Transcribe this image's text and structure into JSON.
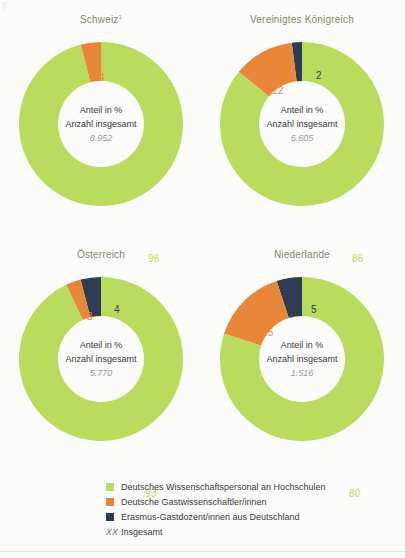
{
  "chart_data": {
    "type": "pie",
    "variant": "donut-grid",
    "title": "",
    "subtitle": "",
    "center_labels": {
      "line1": "Anteil in %",
      "line2": "Anzahl insgesamt"
    },
    "series": [
      {
        "name": "Deutsches Wissenschaftspersonal an Hochschulen",
        "color": "#b9dc5e",
        "values": [
          96,
          86,
          93,
          80
        ]
      },
      {
        "name": "Deutsche Gastwissenschaftler/innen",
        "color": "#e8873a",
        "values": [
          4,
          12,
          3,
          15
        ]
      },
      {
        "name": "Erasmus-Gastdozent/innen aus Deutschland",
        "color": "#2f3d54",
        "values": [
          0,
          2,
          4,
          5
        ]
      }
    ],
    "categories": [
      "Schweiz",
      "Vereinigtes Königreich",
      "Österreich",
      "Niederlande"
    ],
    "totals": [
      "8.952",
      "6.605",
      "5.770",
      "1.516"
    ],
    "charts": [
      {
        "title": "Schweiz",
        "footnote_marker": "1",
        "total": "8.952",
        "segments": [
          {
            "key": "erasmus",
            "value": 0,
            "label": "",
            "color": "#2f3d54",
            "show_label": false
          },
          {
            "key": "gast",
            "value": 4,
            "label": "4",
            "color": "#e8873a",
            "show_label": true,
            "label_x": 82,
            "label_y": 32
          },
          {
            "key": "personal",
            "value": 96,
            "label": "96",
            "color": "#b9dc5e",
            "show_label": true,
            "label_x": 131,
            "label_y": 213
          }
        ]
      },
      {
        "title": "Vereinigtes Königreich",
        "footnote_marker": "",
        "total": "6.605",
        "segments": [
          {
            "key": "erasmus",
            "value": 2,
            "label": "2",
            "color": "#2f3d54",
            "show_label": true,
            "label_x": 98,
            "label_y": 30
          },
          {
            "key": "gast",
            "value": 12,
            "label": "12",
            "color": "#e8873a",
            "show_label": true,
            "label_x": 54,
            "label_y": 45
          },
          {
            "key": "personal",
            "value": 86,
            "label": "86",
            "color": "#b9dc5e",
            "show_label": true,
            "label_x": 134,
            "label_y": 213
          }
        ]
      },
      {
        "title": "Österreich",
        "footnote_marker": "",
        "total": "5.770",
        "segments": [
          {
            "key": "erasmus",
            "value": 4,
            "label": "4",
            "color": "#2f3d54",
            "show_label": true,
            "label_x": 97,
            "label_y": 29
          },
          {
            "key": "gast",
            "value": 3,
            "label": "3",
            "color": "#e8873a",
            "show_label": true,
            "label_x": 70,
            "label_y": 36
          },
          {
            "key": "personal",
            "value": 93,
            "label": "93",
            "color": "#b9dc5e",
            "show_label": true,
            "label_x": 128,
            "label_y": 213
          }
        ]
      },
      {
        "title": "Niederlande",
        "footnote_marker": "",
        "total": "1.516",
        "segments": [
          {
            "key": "erasmus",
            "value": 5,
            "label": "5",
            "color": "#2f3d54",
            "show_label": true,
            "label_x": 93,
            "label_y": 29
          },
          {
            "key": "gast",
            "value": 15,
            "label": "15",
            "color": "#e8873a",
            "show_label": true,
            "label_x": 44,
            "label_y": 52
          },
          {
            "key": "personal",
            "value": 80,
            "label": "80",
            "color": "#b9dc5e",
            "show_label": true,
            "label_x": 131,
            "label_y": 213
          }
        ]
      }
    ],
    "legend": {
      "position": "bottom",
      "items": [
        {
          "label": "Deutsches Wissenschaftspersonal an Hochschulen",
          "color": "#b9dc5e",
          "marker": "swatch"
        },
        {
          "label": "Deutsche Gastwissenschaftler/innen",
          "color": "#e8873a",
          "marker": "swatch"
        },
        {
          "label": "Erasmus-Gastdozent/innen aus Deutschland",
          "color": "#2f3d54",
          "marker": "swatch"
        },
        {
          "label": "Insgesamt",
          "color": "#77776f",
          "marker": "XX"
        }
      ]
    },
    "colors": {
      "green": "#b9dc5e",
      "orange": "#e8873a",
      "navy": "#2f3d54",
      "title": "#7f8a6e",
      "total_text": "#9a9a93",
      "background": "#fcfcfa"
    }
  }
}
